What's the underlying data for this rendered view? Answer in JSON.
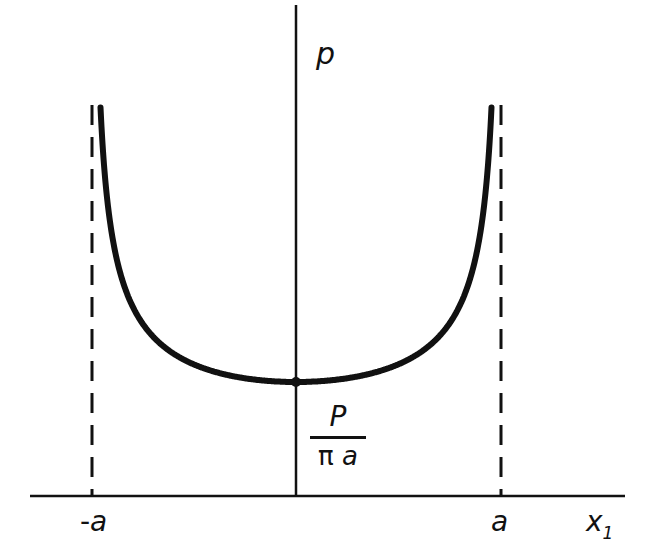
{
  "diagram": {
    "title": "",
    "labels": {
      "y_axis": "p",
      "x_axis": "x",
      "x_axis_subscript": "1",
      "left_bound": "-a",
      "left_bound_sign": "-",
      "left_bound_var": "a",
      "right_bound": "a",
      "min_value_numerator": "P",
      "min_value_denominator_pi": "π",
      "min_value_denominator_var": "a"
    },
    "colors": {
      "ink": "#111111",
      "background": "#ffffff"
    },
    "geometry": {
      "x_axis_y": 496,
      "x_axis_from": 30,
      "x_axis_to": 625,
      "y_axis_x": 296,
      "y_axis_from": 5,
      "left_dashed_x": 92,
      "right_dashed_x": 501,
      "dashed_top": 105,
      "min_point": [
        296,
        382
      ]
    }
  },
  "chart_data": {
    "type": "line",
    "title": "",
    "xlabel": "x1",
    "ylabel": "p",
    "function": "p(x1) = P / (π sqrt(a² - x1²))",
    "minimum": {
      "x": 0,
      "y": "P/(πa)"
    },
    "asymptotes": [
      "x1 = -a",
      "x1 = a"
    ],
    "tick_labels": [
      "-a",
      "a"
    ],
    "grid": false
  }
}
